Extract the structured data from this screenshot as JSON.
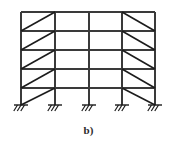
{
  "figure": {
    "caption": "b)",
    "kind": "structural-frame-elevation",
    "colors": {
      "member": "#3a3a3a",
      "brace": "#1c1c1c",
      "support": "#1c1c1c",
      "background": "#ffffff",
      "caption": "#2b2b2b"
    },
    "geometry": {
      "column_x": [
        21,
        55,
        89,
        122,
        155
      ],
      "beam_y": [
        12,
        31,
        50,
        69,
        88
      ],
      "base_y": 105,
      "member_width": 2.0,
      "brace_width": 1.6,
      "support_half_width": 7,
      "support_hatch_count": 3,
      "support_hatch_length": 6
    },
    "counts": {
      "stories": 5,
      "bays": 4,
      "columns": 5,
      "beams": 5,
      "supports": 5,
      "braces": 10
    },
    "bays": [
      {
        "id": "bay-1",
        "left_col": 0,
        "right_col": 1,
        "braced": true,
        "brace_direction": "bottom-left-to-top-right"
      },
      {
        "id": "bay-2",
        "left_col": 1,
        "right_col": 2,
        "braced": false,
        "brace_direction": "none"
      },
      {
        "id": "bay-3",
        "left_col": 2,
        "right_col": 3,
        "braced": false,
        "brace_direction": "none"
      },
      {
        "id": "bay-4",
        "left_col": 3,
        "right_col": 4,
        "braced": true,
        "brace_direction": "top-left-to-bottom-right"
      }
    ],
    "supports": [
      {
        "id": "support-1",
        "x": 21,
        "type": "fixed"
      },
      {
        "id": "support-2",
        "x": 55,
        "type": "fixed"
      },
      {
        "id": "support-3",
        "x": 89,
        "type": "fixed"
      },
      {
        "id": "support-4",
        "x": 122,
        "type": "fixed"
      },
      {
        "id": "support-5",
        "x": 155,
        "type": "fixed"
      }
    ]
  }
}
